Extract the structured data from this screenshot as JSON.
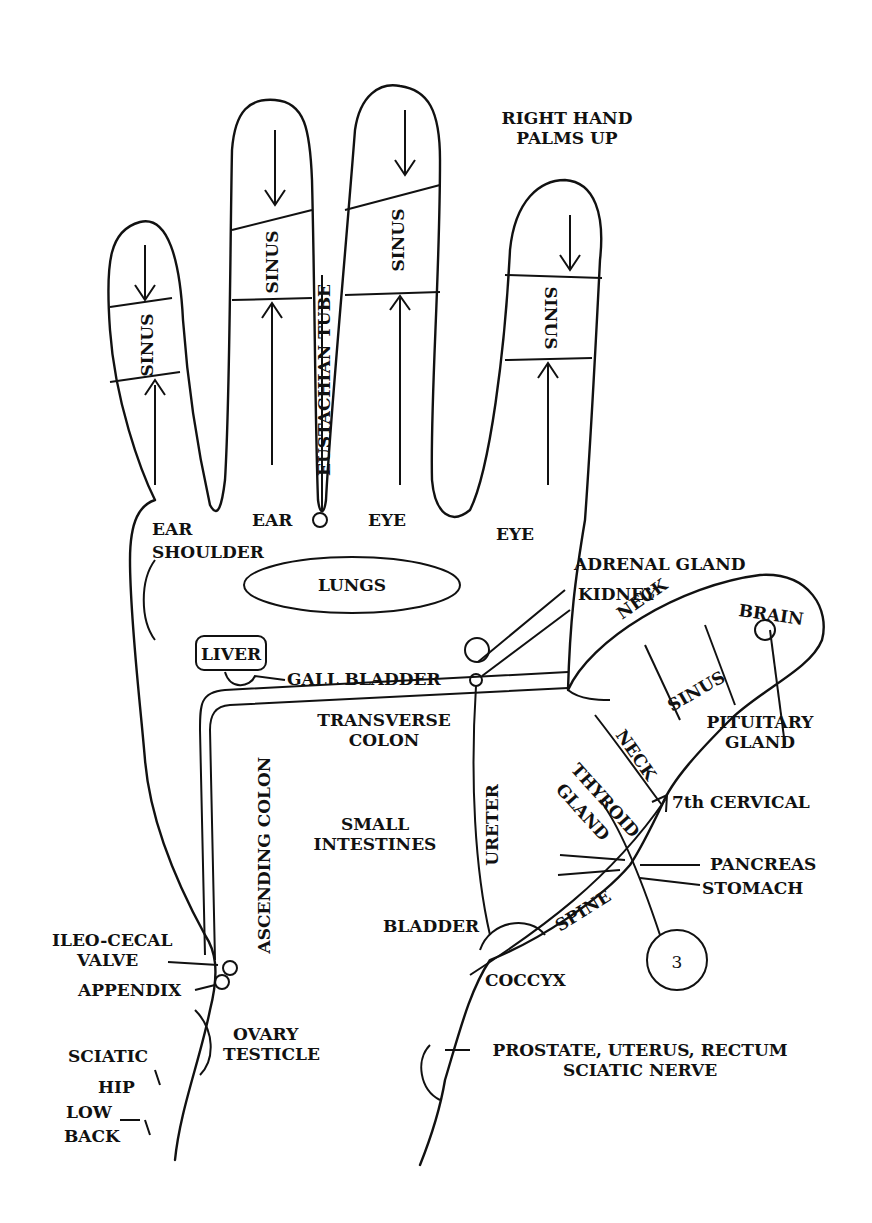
{
  "title": {
    "line1": "RIGHT HAND",
    "line2": "PALMS UP"
  },
  "fingers": {
    "pinky": {
      "zone": "SINUS",
      "base_label": "EAR"
    },
    "ring": {
      "zone": "SINUS",
      "base_label": "EAR"
    },
    "ring_side": {
      "label": "EUSTACHIAN TUBE"
    },
    "middle": {
      "zone": "SINUS",
      "base_label": "EYE"
    },
    "index": {
      "zone": "SINUS",
      "base_label": "EYE"
    }
  },
  "thumb": {
    "neck_top": "NECK",
    "brain": "BRAIN",
    "sinus": "SINUS",
    "neck_bottom": "NECK",
    "pituitary": {
      "line1": "PITUITARY",
      "line2": "GLAND"
    }
  },
  "labels": {
    "shoulder": "SHOULDER",
    "lungs": "LUNGS",
    "liver": "LIVER",
    "gall_bladder": "GALL BLADDER",
    "adrenal_gland": "ADRENAL GLAND",
    "kidney": "KIDNEY",
    "transverse_colon": {
      "line1": "TRANSVERSE",
      "line2": "COLON"
    },
    "ascending_colon": "ASCENDING COLON",
    "small_intestines": {
      "line1": "SMALL",
      "line2": "INTESTINES"
    },
    "ureter": "URETER",
    "thyroid_gland": {
      "line1": "THYROID",
      "line2": "GLAND"
    },
    "cervical": "7th CERVICAL",
    "pancreas": "PANCREAS",
    "stomach": "STOMACH",
    "spine": "SPINE",
    "bladder": "BLADDER",
    "coccyx": "COCCYX",
    "ileo_cecal": {
      "line1": "ILEO-CECAL",
      "line2": "VALVE"
    },
    "appendix": "APPENDIX",
    "ovary": {
      "line1": "OVARY",
      "line2": "TESTICLE"
    },
    "sciatic": "SCIATIC",
    "hip": "HIP",
    "low_back": {
      "line1": "LOW",
      "line2": "BACK"
    },
    "prostate": {
      "line1": "PROSTATE, UTERUS, RECTUM",
      "line2": "SCIATIC NERVE"
    },
    "circled_number": "3"
  }
}
